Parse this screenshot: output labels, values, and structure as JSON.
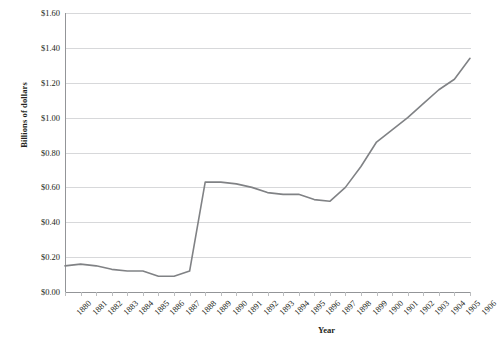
{
  "chart_data": {
    "type": "line",
    "title": "",
    "xlabel": "Year",
    "ylabel": "Billions of dollars",
    "categories": [
      "1880",
      "1881",
      "1882",
      "1883",
      "1884",
      "1885",
      "1886",
      "1887",
      "1888",
      "1889",
      "1890",
      "1891",
      "1892",
      "1893",
      "1894",
      "1895",
      "1896",
      "1897",
      "1898",
      "1899",
      "1900",
      "1901",
      "1902",
      "1903",
      "1904",
      "1905",
      "1906"
    ],
    "values": [
      0.15,
      0.16,
      0.15,
      0.13,
      0.12,
      0.12,
      0.09,
      0.09,
      0.12,
      0.63,
      0.63,
      0.62,
      0.6,
      0.57,
      0.56,
      0.56,
      0.53,
      0.52,
      0.6,
      0.72,
      0.86,
      0.93,
      1.0,
      1.08,
      1.16,
      1.22,
      1.34
    ],
    "ylim": [
      0.0,
      1.6
    ],
    "ytick_step": 0.2,
    "ytick_labels": [
      "$0.00",
      "$0.20",
      "$0.40",
      "$0.60",
      "$0.80",
      "$1.00",
      "$1.20",
      "$1.40",
      "$1.60"
    ],
    "ytick_values": [
      0.0,
      0.2,
      0.4,
      0.6,
      0.8,
      1.0,
      1.2,
      1.4,
      1.6
    ],
    "grid": true,
    "legend": "none",
    "series_color": "#808285",
    "gridline_color": "#d7d8da",
    "axis_color": "#939598",
    "text_color": "#231f20",
    "background": "#ffffff"
  }
}
